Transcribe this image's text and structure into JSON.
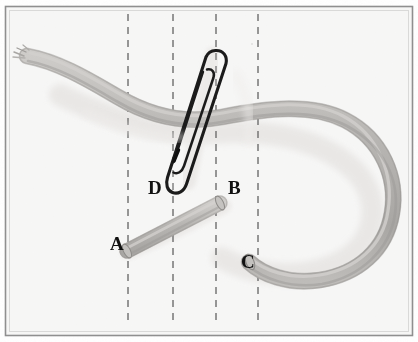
{
  "figure": {
    "background_color": "#fbfbfb",
    "frame": {
      "name": "image-border",
      "color": "#8a8a8a",
      "inner_color": "#b9b9b9",
      "x": 5,
      "y": 6,
      "width": 408,
      "height": 330
    },
    "labels": [
      {
        "id": "A",
        "text": "A",
        "x": 110,
        "y": 234
      },
      {
        "id": "B",
        "text": "B",
        "x": 228,
        "y": 178
      },
      {
        "id": "C",
        "text": "C",
        "x": 241,
        "y": 252
      },
      {
        "id": "D",
        "text": "D",
        "x": 148,
        "y": 178
      }
    ],
    "guide_lines": {
      "name": "dashed-reference-lines",
      "color": "#6d6d6d",
      "dash": "7 6",
      "stroke_width": 1.4,
      "y_top": 14,
      "y_bottom": 326,
      "x_positions": [
        128,
        173,
        216,
        258
      ]
    },
    "rope": {
      "fill": "#b3b1ae",
      "fill_light": "#c9c7c4",
      "edge": "#8d8b88",
      "shadow": "#e2e0de",
      "highlight": "#d8d6d3"
    },
    "paperclip": {
      "stroke": "#1b1b1b",
      "stroke_width": 3.2,
      "inner_stroke_width": 2.4,
      "fill": "#ffffff"
    },
    "segment_ab": {
      "name": "cut-rope-segment-a-b",
      "fill": "#b6b4b1",
      "edge": "#8f8d8a"
    }
  }
}
